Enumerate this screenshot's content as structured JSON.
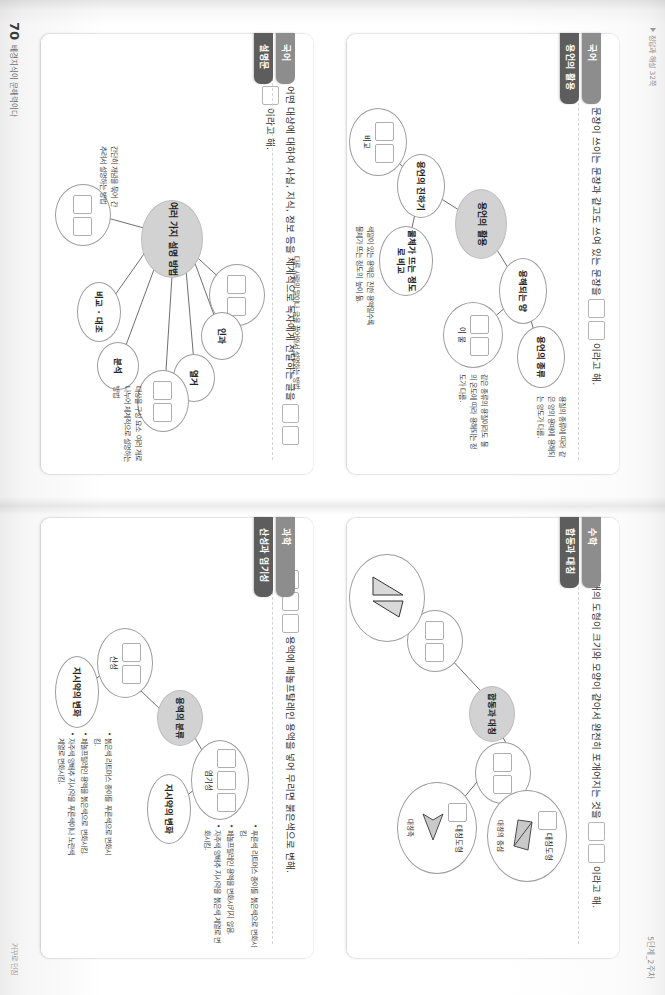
{
  "header": {
    "right_mark": "5단계_2주차",
    "left_mark": "정답과 해설 32쪽"
  },
  "footer": {
    "page_number": "70",
    "book_title": "배경지식이 문해력이다",
    "right_mark": "거꾸로 던짐"
  },
  "cards": [
    {
      "id": "card-korean-conjugation",
      "subject": "국어",
      "topic": "용언의 활용",
      "head_before": "쓰는 문장이 쓰이는 문장과 같고도 쓰여 있는 문장을",
      "head_blanks": [
        "용",
        "언"
      ],
      "head_after": "이라고 해.",
      "center": "용언의 활용",
      "nodes": [
        {
          "label": "용해되는 양",
          "kind": "ellipse"
        },
        {
          "label": "용언의 종류",
          "kind": "ellipse"
        },
        {
          "label": "용언의 진하기",
          "kind": "ellipse"
        },
        {
          "label": "물체가 뜨는 정도로 비교",
          "kind": "ellipse"
        },
        {
          "label": "이 물",
          "boxes": [
            "예",
            "나"
          ],
          "kind": "ellipse-boxes"
        },
        {
          "label": "비교",
          "boxes": [
            "색",
            "깔"
          ],
          "kind": "ellipse-boxes"
        }
      ],
      "notes": [
        "용질의 종류에 따라 같은 양의 용매에 용해되는 양도가 다름.",
        "같은 종류의 용질이라도 물의 온도에 따라 용해되는 정도가 다름.",
        "색깔이 있는 용액은 진한 용액일수록 물체가 뜨는 정도의 높이 듦.",
        "색깔이 있는 용액은 진한 용액일수록 색깔이 진함."
      ]
    },
    {
      "id": "card-korean-exposition",
      "subject": "국어",
      "topic": "설명문",
      "head_before": "어떤 대상에 대하여 사실, 지식, 정보 등을 체계적으로 독자에게 전달하는 글을",
      "head_blanks": [
        "설",
        "명",
        "문"
      ],
      "head_after": "이라고 해.",
      "center": "여러 가지 설명 방법",
      "nodes": [
        {
          "label": "예시",
          "boxes": [
            "인",
            "예"
          ],
          "kind": "ellipse-boxes"
        },
        {
          "label": "인과",
          "kind": "ellipse"
        },
        {
          "label": "열거",
          "kind": "ellipse"
        },
        {
          "label": "분류",
          "boxes": [
            "분",
            "석"
          ],
          "kind": "ellipse-boxes"
        },
        {
          "label": "분석",
          "kind": "ellipse"
        },
        {
          "label": "비교 · 대조",
          "kind": "ellipse"
        },
        {
          "label": "정의",
          "boxes": [
            "정",
            "의"
          ],
          "kind": "ellipse-boxes"
        }
      ],
      "notes": [
        "다른 사람의 말이나 글을 끌어와서 설명하는 방법",
        "대상을 구성 요소 여러 개로 나누어 체계적으로 설명하는 방법",
        "간단히 개념을 묶어 간추려서 설명하는 방법"
      ]
    },
    {
      "id": "card-math-congruence",
      "subject": "수학",
      "topic": "합동과 대칭",
      "head_before": "두 개의 도형이 크기와 모양이 같아서 완전히 포개어지는 것을",
      "head_blanks": [
        "합",
        "동"
      ],
      "head_after": "이라고 해.",
      "center": "합동과 대칭",
      "nodes": [
        {
          "label": "합동",
          "boxes": [
            "합",
            "동"
          ],
          "kind": "ellipse-boxes"
        },
        {
          "label": "대칭",
          "boxes": [
            "대",
            "칭"
          ],
          "kind": "ellipse-boxes"
        },
        {
          "label": "대칭도형",
          "boxes": [
            "점"
          ],
          "sub": "대칭의 중심",
          "kind": "shape-node"
        },
        {
          "label": "대칭도형",
          "boxes": [
            "선"
          ],
          "sub": "대칭축",
          "kind": "shape-node"
        },
        {
          "label": "합동인 도형",
          "kind": "shape-node"
        }
      ],
      "notes": []
    },
    {
      "id": "card-science-acid-base",
      "subject": "과학",
      "topic": "산성과 염기성",
      "head_before": "용액에 페놀프탈레인 용액을 넣어 무리면 붉은색으로 변해.",
      "head_blanks": [
        "염",
        "기",
        "성"
      ],
      "head_after": "",
      "center": "용액의 분류",
      "nodes": [
        {
          "label": "염기성",
          "boxes": [
            "염",
            "기",
            "성"
          ],
          "kind": "ellipse-boxes"
        },
        {
          "label": "산성",
          "boxes": [
            "산",
            "성"
          ],
          "kind": "ellipse-boxes"
        },
        {
          "label": "지시약의 변화",
          "kind": "ellipse"
        },
        {
          "label": "지시약의 변화",
          "kind": "ellipse"
        }
      ],
      "notes": [
        "푸른색 리트머스 종이를 붉은색으로 변화시킴.",
        "페놀프탈레인 용액을 변화시키지 않음.",
        "자주색 양배추 지시약을 붉은색 계열로 변화시킴.",
        "붉은색 리트머스 종이를 푸른색으로 변화시킴.",
        "페놀프탈레인 용액을 붉은색으로 변화시킴.",
        "자주색 양배추 지시약을 푸른색이나 노란색 계열로 변화시킴."
      ]
    }
  ]
}
